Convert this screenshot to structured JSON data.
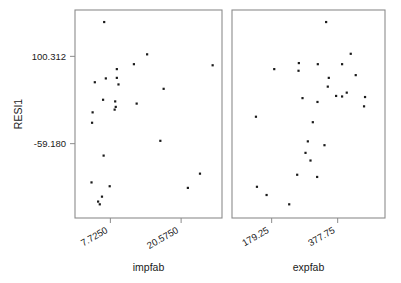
{
  "chart_data": {
    "type": "scatter",
    "title": "",
    "ylabel": "RESI1",
    "ylim": [
      -195,
      185
    ],
    "y_ticks": [
      {
        "value": 100.312,
        "label": "100.312"
      },
      {
        "value": -59.18,
        "label": "-59.180"
      }
    ],
    "grid": false,
    "legend": false,
    "panels": [
      {
        "name": "impfab-panel",
        "xlabel": "impfab",
        "xlim": [
          1.3,
          28.0
        ],
        "x_ticks": [
          {
            "value": 7.725,
            "label": "7.7250"
          },
          {
            "value": 20.575,
            "label": "20.5750"
          }
        ],
        "points": [
          {
            "x": 6.6,
            "y": 163
          },
          {
            "x": 14.4,
            "y": 104
          },
          {
            "x": 12.0,
            "y": 86
          },
          {
            "x": 26.3,
            "y": 84
          },
          {
            "x": 8.9,
            "y": 77
          },
          {
            "x": 8.9,
            "y": 61
          },
          {
            "x": 6.9,
            "y": 60
          },
          {
            "x": 4.9,
            "y": 53
          },
          {
            "x": 9.2,
            "y": 49
          },
          {
            "x": 17.4,
            "y": 41
          },
          {
            "x": 6.4,
            "y": 21
          },
          {
            "x": 8.6,
            "y": 18
          },
          {
            "x": 12.5,
            "y": 14
          },
          {
            "x": 8.7,
            "y": 8
          },
          {
            "x": 8.5,
            "y": 3
          },
          {
            "x": 4.5,
            "y": -2
          },
          {
            "x": 4.4,
            "y": -21
          },
          {
            "x": 16.8,
            "y": -54
          },
          {
            "x": 6.5,
            "y": -81
          },
          {
            "x": 24.0,
            "y": -114
          },
          {
            "x": 4.3,
            "y": -130
          },
          {
            "x": 7.6,
            "y": -137
          },
          {
            "x": 21.8,
            "y": -140
          },
          {
            "x": 6.2,
            "y": -156
          },
          {
            "x": 5.5,
            "y": -165
          },
          {
            "x": 5.8,
            "y": -170
          }
        ]
      },
      {
        "name": "expfab-panel",
        "xlabel": "expfab",
        "xlim": [
          60,
          520
        ],
        "x_ticks": [
          {
            "value": 179.25,
            "label": "179.25"
          },
          {
            "value": 377.75,
            "label": "377.75"
          }
        ],
        "points": [
          {
            "x": 343,
            "y": 163
          },
          {
            "x": 417,
            "y": 105
          },
          {
            "x": 261,
            "y": 88
          },
          {
            "x": 318,
            "y": 86
          },
          {
            "x": 391,
            "y": 86
          },
          {
            "x": 187,
            "y": 77
          },
          {
            "x": 260,
            "y": 74
          },
          {
            "x": 432,
            "y": 66
          },
          {
            "x": 351,
            "y": 61
          },
          {
            "x": 348,
            "y": 45
          },
          {
            "x": 405,
            "y": 34
          },
          {
            "x": 373,
            "y": 28
          },
          {
            "x": 391,
            "y": 27
          },
          {
            "x": 460,
            "y": 26
          },
          {
            "x": 272,
            "y": 24
          },
          {
            "x": 317,
            "y": 17
          },
          {
            "x": 457,
            "y": 9
          },
          {
            "x": 132,
            "y": -10
          },
          {
            "x": 303,
            "y": -20
          },
          {
            "x": 288,
            "y": -55
          },
          {
            "x": 338,
            "y": -62
          },
          {
            "x": 281,
            "y": -76
          },
          {
            "x": 296,
            "y": -90
          },
          {
            "x": 256,
            "y": -116
          },
          {
            "x": 316,
            "y": -120
          },
          {
            "x": 135,
            "y": -138
          },
          {
            "x": 164,
            "y": -153
          },
          {
            "x": 232,
            "y": -170
          }
        ]
      }
    ]
  }
}
